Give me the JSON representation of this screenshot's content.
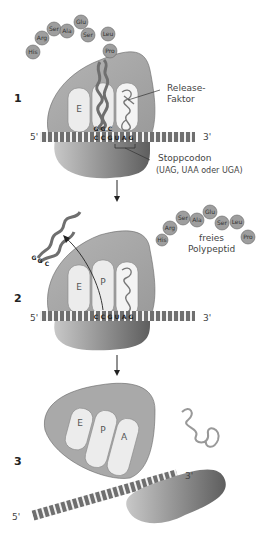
{
  "steps": [
    {
      "number": "1",
      "polypeptide": [
        "His",
        "Arg",
        "Ser",
        "Ala",
        "Glu",
        "Ser",
        "Leu",
        "Pro"
      ],
      "sites": [
        "E"
      ],
      "anticodon": [
        "G",
        "G",
        "C"
      ],
      "mrna_codons": [
        "C",
        "C",
        "G",
        "U",
        "A",
        "G"
      ],
      "mrna_5": "5'",
      "mrna_3": "3'",
      "release_factor_label": "Release-\nFaktor",
      "stop_codon_label": "Stoppcodon",
      "stop_codon_variants": "(UAG, UAA oder UGA)"
    },
    {
      "number": "2",
      "polypeptide": [
        "His",
        "Arg",
        "Ser",
        "Ala",
        "Glu",
        "Ser",
        "Leu",
        "Pro"
      ],
      "sites": [
        "E",
        "P"
      ],
      "anticodon": [
        "G",
        "G",
        "C"
      ],
      "mrna_codons": [
        "C",
        "C",
        "G",
        "U",
        "A",
        "G"
      ],
      "mrna_5": "5'",
      "mrna_3": "3'",
      "free_polypeptide_label": "freies\nPolypeptid"
    },
    {
      "number": "3",
      "sites": [
        "E",
        "P",
        "A"
      ],
      "mrna_5": "5'",
      "mrna_3": "3'"
    }
  ],
  "colors": {
    "ribosome_large": "#a9a9a9",
    "ribosome_small": "#8a8a8a",
    "site": "#ececec",
    "trna": "#7a7a7a",
    "amino_acid": "#9e9e9e",
    "mrna": "#6f6f6f"
  }
}
